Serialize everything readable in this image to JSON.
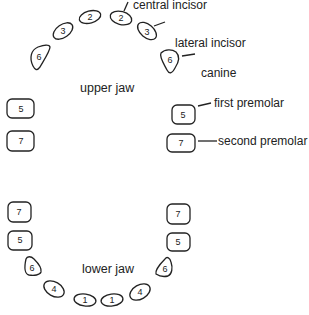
{
  "diagram": {
    "type": "dental chart",
    "upper_jaw": {
      "label": "upper jaw",
      "teeth": [
        {
          "number": "7",
          "side": "left"
        },
        {
          "number": "5",
          "side": "left"
        },
        {
          "number": "6",
          "side": "left"
        },
        {
          "number": "3",
          "side": "left"
        },
        {
          "number": "2",
          "side": "left"
        },
        {
          "number": "2",
          "side": "right"
        },
        {
          "number": "3",
          "side": "right"
        },
        {
          "number": "6",
          "side": "right"
        },
        {
          "number": "5",
          "side": "right"
        },
        {
          "number": "7",
          "side": "right"
        }
      ]
    },
    "lower_jaw": {
      "label": "lower jaw",
      "teeth": [
        {
          "number": "7",
          "side": "left"
        },
        {
          "number": "5",
          "side": "left"
        },
        {
          "number": "6",
          "side": "left"
        },
        {
          "number": "4",
          "side": "left"
        },
        {
          "number": "1",
          "side": "left"
        },
        {
          "number": "1",
          "side": "right"
        },
        {
          "number": "4",
          "side": "right"
        },
        {
          "number": "6",
          "side": "right"
        },
        {
          "number": "5",
          "side": "right"
        },
        {
          "number": "7",
          "side": "right"
        }
      ]
    },
    "annotations": [
      {
        "text": "central incisor"
      },
      {
        "text": "lateral incisor"
      },
      {
        "text": "canine"
      },
      {
        "text": "first premolar"
      },
      {
        "text": "second premolar"
      }
    ]
  }
}
